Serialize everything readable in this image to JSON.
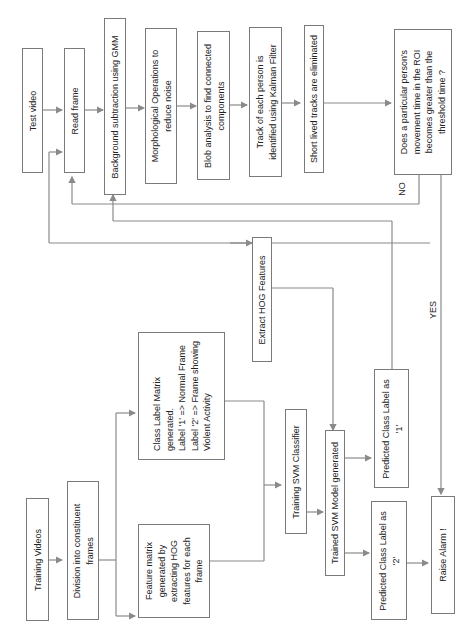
{
  "diagram": {
    "orientation": "rotated -90deg",
    "nodes": {
      "test_video": "Test video",
      "read_frame": "Read frame",
      "bg_subtraction": "Background subtraction using GMM",
      "morph_ops": [
        "Morphological Operations to",
        "reduce noise"
      ],
      "blob_analysis": [
        "Blob analysis to find connected",
        "components"
      ],
      "track_kalman": [
        "Track of each person is",
        "identified using Kalman Filter"
      ],
      "short_lived": "Short lived tracks are eliminated",
      "decision": [
        "Does a particular person's",
        "movement time in the ROI",
        "becomes greater than the",
        "threshold time ?"
      ],
      "extract_hog": "Extract HOG Features",
      "training_videos": "Training Videos",
      "division_frames": [
        "Division into constituent",
        "frames"
      ],
      "class_label_matrix": [
        "Class Label Matrix",
        "generated.",
        "Label '1' => Normal Frame",
        "Label '2' => Frame showing",
        "Violent Activity"
      ],
      "feature_matrix": [
        "Feature matrix",
        "generated by",
        "extracting HOG",
        "features for each",
        "frame"
      ],
      "training_svm": "Training SVM Classifier",
      "trained_svm": "Trained SVM Model generated",
      "predicted_1": [
        "Predicted Class Label as",
        "'1'"
      ],
      "predicted_2": [
        "Predicted Class Label as",
        "'2'"
      ],
      "raise_alarm": "Raise Alarm !"
    },
    "edge_labels": {
      "no": "NO",
      "yes": "YES"
    },
    "colors": {
      "line": "#8a8a8a",
      "border": "#7a7a7a",
      "text": "#222222"
    }
  }
}
